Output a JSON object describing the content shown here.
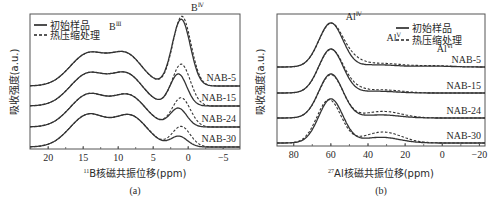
{
  "figure": {
    "panels": [
      {
        "id": "a",
        "caption": "(a)",
        "xlabel_sup": "11",
        "xlabel": "B核磁共振位移(ppm)",
        "ylabel": "吸收强度(a.u.)",
        "legend": {
          "solid": "初始样品",
          "dashed": "热压缩处理"
        },
        "annotations": [
          {
            "text": "B",
            "sup": "Ⅲ",
            "x": 11.3,
            "label": "B-III peak"
          },
          {
            "text": "B",
            "sup": "Ⅳ",
            "x": -0.4,
            "label": "B-IV peak"
          }
        ],
        "samples": [
          "NAB-5",
          "NAB-15",
          "NAB-24",
          "NAB-30"
        ]
      },
      {
        "id": "b",
        "caption": "(b)",
        "xlabel_sup": "27",
        "xlabel": "Al核磁共振位移(ppm)",
        "ylabel": "吸收强度(a.u.)",
        "legend": {
          "solid": "初始样品",
          "dashed": "热压缩处理"
        },
        "annotations": [
          {
            "text": "Al",
            "sup": "Ⅳ",
            "x": 52,
            "label": "Al-IV peak"
          },
          {
            "text": "Al",
            "sup": "Ⅴ",
            "x": 30,
            "label": "Al-V peak"
          },
          {
            "text": "Al",
            "sup": "Ⅵ",
            "x": 3,
            "label": "Al-VI peak"
          }
        ],
        "samples": [
          "NAB-5",
          "NAB-15",
          "NAB-24",
          "NAB-30"
        ]
      }
    ]
  },
  "chart_data": [
    {
      "type": "line",
      "title": "(a)",
      "xlabel": "11B核磁共振位移(ppm)",
      "ylabel": "吸收强度(a.u.)",
      "xlim": [
        22.6,
        -7.4
      ],
      "xticks": [
        20,
        15,
        10,
        5,
        0,
        -5
      ],
      "legend": [
        "初始样品 (solid)",
        "热压缩处理 (dashed)"
      ],
      "legend_position": "upper left",
      "grid": false,
      "stacked_offsets": true,
      "series": [
        {
          "name": "NAB-5",
          "offset": 0.0,
          "peaks_initial": [
            {
              "c": 14.3,
              "h": 0.55,
              "w": 2.6
            },
            {
              "c": 8.8,
              "h": 0.52,
              "w": 2.3
            },
            {
              "c": 1.0,
              "h": 1.15,
              "w": 1.3
            }
          ],
          "peaks_pressed": [
            {
              "c": 14.3,
              "h": 0.55,
              "w": 2.6
            },
            {
              "c": 8.8,
              "h": 0.52,
              "w": 2.3
            },
            {
              "c": 0.9,
              "h": 1.2,
              "w": 1.3
            }
          ]
        },
        {
          "name": "NAB-15",
          "offset": 0.0,
          "peaks_initial": [
            {
              "c": 14.3,
              "h": 0.55,
              "w": 2.6
            },
            {
              "c": 8.7,
              "h": 0.52,
              "w": 2.3
            },
            {
              "c": 1.4,
              "h": 0.55,
              "w": 1.2
            }
          ],
          "peaks_pressed": [
            {
              "c": 14.3,
              "h": 0.55,
              "w": 2.6
            },
            {
              "c": 8.7,
              "h": 0.52,
              "w": 2.3
            },
            {
              "c": 1.0,
              "h": 0.72,
              "w": 1.3
            }
          ]
        },
        {
          "name": "NAB-24",
          "offset": 0.0,
          "peaks_initial": [
            {
              "c": 14.3,
              "h": 0.55,
              "w": 2.6
            },
            {
              "c": 8.4,
              "h": 0.52,
              "w": 2.4
            },
            {
              "c": 1.4,
              "h": 0.32,
              "w": 1.2
            }
          ],
          "peaks_pressed": [
            {
              "c": 14.3,
              "h": 0.55,
              "w": 2.6
            },
            {
              "c": 8.4,
              "h": 0.52,
              "w": 2.4
            },
            {
              "c": 1.0,
              "h": 0.5,
              "w": 1.3
            }
          ]
        },
        {
          "name": "NAB-30",
          "offset": 0.0,
          "peaks_initial": [
            {
              "c": 14.3,
              "h": 0.55,
              "w": 2.6
            },
            {
              "c": 8.2,
              "h": 0.52,
              "w": 2.4
            },
            {
              "c": 1.3,
              "h": 0.18,
              "w": 1.2
            }
          ],
          "peaks_pressed": [
            {
              "c": 14.3,
              "h": 0.55,
              "w": 2.6
            },
            {
              "c": 8.2,
              "h": 0.52,
              "w": 2.4
            },
            {
              "c": 1.0,
              "h": 0.35,
              "w": 1.3
            }
          ]
        }
      ]
    },
    {
      "type": "line",
      "title": "(b)",
      "xlabel": "27Al核磁共振位移(ppm)",
      "ylabel": "吸收强度(a.u.)",
      "xlim": [
        89,
        -23
      ],
      "xticks": [
        80,
        60,
        40,
        20,
        0,
        -20
      ],
      "legend": [
        "初始样品 (solid)",
        "热压缩处理 (dashed)"
      ],
      "legend_position": "upper right",
      "grid": false,
      "stacked_offsets": true,
      "series": [
        {
          "name": "NAB-5",
          "peaks_initial": [
            {
              "c": 60,
              "h": 1.0,
              "w": 6.5
            },
            {
              "c": 35,
              "h": 0.05,
              "w": 10
            },
            {
              "c": 5,
              "h": 0.02,
              "w": 10
            }
          ],
          "peaks_pressed": [
            {
              "c": 60,
              "h": 0.98,
              "w": 6.5
            },
            {
              "c": 48,
              "h": 0.12,
              "w": 6
            },
            {
              "c": 32,
              "h": 0.08,
              "w": 10
            },
            {
              "c": 5,
              "h": 0.03,
              "w": 10
            }
          ]
        },
        {
          "name": "NAB-15",
          "peaks_initial": [
            {
              "c": 60,
              "h": 1.0,
              "w": 6.5
            },
            {
              "c": 35,
              "h": 0.04,
              "w": 10
            }
          ],
          "peaks_pressed": [
            {
              "c": 60,
              "h": 0.98,
              "w": 6.5
            },
            {
              "c": 48,
              "h": 0.08,
              "w": 6
            },
            {
              "c": 32,
              "h": 0.07,
              "w": 10
            }
          ]
        },
        {
          "name": "NAB-24",
          "peaks_initial": [
            {
              "c": 60,
              "h": 1.0,
              "w": 6.5
            },
            {
              "c": 33,
              "h": 0.07,
              "w": 10
            }
          ],
          "peaks_pressed": [
            {
              "c": 60,
              "h": 0.98,
              "w": 6.5
            },
            {
              "c": 32,
              "h": 0.15,
              "w": 10
            }
          ]
        },
        {
          "name": "NAB-30",
          "peaks_initial": [
            {
              "c": 60,
              "h": 1.0,
              "w": 6.5
            },
            {
              "c": 33,
              "h": 0.13,
              "w": 10
            }
          ],
          "peaks_pressed": [
            {
              "c": 61,
              "h": 0.98,
              "w": 6.5
            },
            {
              "c": 32,
              "h": 0.25,
              "w": 10
            }
          ]
        }
      ]
    }
  ]
}
